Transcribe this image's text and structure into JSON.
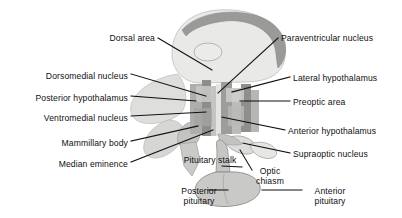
{
  "figure": {
    "background_color": "#ffffff",
    "text_color": "#101010",
    "width": 402,
    "height": 218
  },
  "palette": {
    "brain_pale": "#e9e9e7",
    "corpus_callosum": "#9a9a98",
    "nucleus_mid": "#b4b4b2",
    "nucleus_dark": "#8d8d8b",
    "nucleus_light": "#d2d2d0",
    "pituitary": "#c6c6c4",
    "outline": "#6f6f6d",
    "leader_line": "#111111"
  },
  "labels": [
    {
      "id": "dorsal-area",
      "text": "Dorsal area",
      "side": "left",
      "x": 88,
      "y": 33,
      "w": 67,
      "lines": 1
    },
    {
      "id": "dorsomedial-nucleus",
      "text": "Dorsomedial nucleus",
      "side": "left",
      "x": 24,
      "y": 71,
      "w": 104,
      "lines": 1
    },
    {
      "id": "posterior-hypothalamus",
      "text": "Posterior hypothalamus",
      "side": "left",
      "x": 12,
      "y": 93,
      "w": 116,
      "lines": 1
    },
    {
      "id": "ventromedial-nucleus",
      "text": "Ventromedial nucleus",
      "side": "left",
      "x": 20,
      "y": 113,
      "w": 108,
      "lines": 1
    },
    {
      "id": "mammillary-body",
      "text": "Mammillary body",
      "side": "left",
      "x": 42,
      "y": 138,
      "w": 86,
      "lines": 1
    },
    {
      "id": "median-eminence",
      "text": "Median eminence",
      "side": "left",
      "x": 42,
      "y": 159,
      "w": 86,
      "lines": 1
    },
    {
      "id": "paraventricular-nucleus",
      "text": "Paraventricular nucleus",
      "side": "right",
      "x": 281,
      "y": 33,
      "w": 117,
      "lines": 1
    },
    {
      "id": "lateral-hypothalamus",
      "text": "Lateral hypothalamus",
      "side": "right",
      "x": 293,
      "y": 73,
      "w": 105,
      "lines": 1
    },
    {
      "id": "preoptic-area",
      "text": "Preoptic area",
      "side": "right",
      "x": 293,
      "y": 97,
      "w": 73,
      "lines": 1
    },
    {
      "id": "anterior-hypothalamus",
      "text": "Anterior hypothalamus",
      "side": "right",
      "x": 288,
      "y": 126,
      "w": 110,
      "lines": 1
    },
    {
      "id": "supraoptic-nucleus",
      "text": "Supraoptic nucleus",
      "side": "right",
      "x": 293,
      "y": 149,
      "w": 97,
      "lines": 1
    },
    {
      "id": "pituitary-stalk",
      "text": "Pituitary stalk",
      "side": "center",
      "x": 182,
      "y": 155,
      "w": 56,
      "lines": 2
    },
    {
      "id": "optic-chiasm",
      "text": "Optic chiasm",
      "side": "center",
      "x": 252,
      "y": 166,
      "w": 36,
      "lines": 2
    },
    {
      "id": "posterior-pituitary",
      "text": "Posterior pituitary",
      "side": "center",
      "x": 173,
      "y": 186,
      "w": 52,
      "lines": 2
    },
    {
      "id": "anterior-pituitary",
      "text": "Anterior pituitary",
      "side": "center",
      "x": 305,
      "y": 186,
      "w": 50,
      "lines": 2
    }
  ],
  "leaders": [
    {
      "id": "leader-dorsal-area",
      "points": "158,38 212,70"
    },
    {
      "id": "leader-dorsomedial-nucleus",
      "points": "131,74 206,96"
    },
    {
      "id": "leader-posterior-hypothalamus",
      "points": "131,96 196,101"
    },
    {
      "id": "leader-ventromedial-nucleus",
      "points": "131,116 206,112"
    },
    {
      "id": "leader-mammillary-body",
      "points": "131,141 198,126"
    },
    {
      "id": "leader-median-eminence",
      "points": "131,162 213,130"
    },
    {
      "id": "leader-paraventricular-nucleus",
      "points": "278,38 218,93"
    },
    {
      "id": "leader-lateral-hypothalamus",
      "points": "290,77 232,92"
    },
    {
      "id": "leader-preoptic-area",
      "points": "290,101 240,101"
    },
    {
      "id": "leader-anterior-hypothalamus",
      "points": "285,130 222,117"
    },
    {
      "id": "leader-supraoptic-nucleus",
      "points": "290,153 243,143"
    },
    {
      "id": "leader-pituitary-stalk",
      "points": "242,167 222,166"
    },
    {
      "id": "leader-optic-chiasm",
      "points": "252,170 240,150"
    },
    {
      "id": "leader-posterior-pituitary",
      "points": "228,190 208,190"
    },
    {
      "id": "leader-anterior-pituitary",
      "points": "302,190 262,190"
    }
  ]
}
